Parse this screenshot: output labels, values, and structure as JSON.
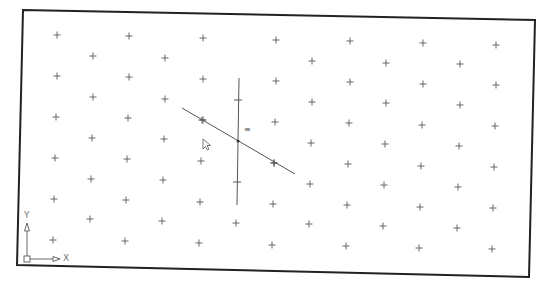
{
  "viewport": {
    "frame_corners": {
      "top_left": [
        23,
        10
      ],
      "top_right": [
        535,
        20
      ],
      "bottom_right": [
        529,
        277
      ],
      "bottom_left": [
        17,
        265
      ]
    },
    "background": "#ffffff",
    "frame_color": "#222222"
  },
  "grid": {
    "marker": "+",
    "color": "#666666",
    "rows": [
      [
        [
          57,
          35
        ],
        [
          129,
          36
        ],
        [
          203,
          38
        ],
        [
          276,
          40
        ],
        [
          350,
          41
        ],
        [
          423,
          43
        ],
        [
          496,
          45
        ]
      ],
      [
        [
          93,
          56
        ],
        [
          165,
          58
        ],
        [
          312,
          61
        ],
        [
          386,
          63
        ],
        [
          460,
          64
        ]
      ],
      [
        [
          57,
          76
        ],
        [
          129,
          77
        ],
        [
          203,
          79
        ],
        [
          276,
          81
        ],
        [
          350,
          82
        ],
        [
          423,
          84
        ],
        [
          496,
          85
        ]
      ],
      [
        [
          93,
          97
        ],
        [
          165,
          99
        ],
        [
          312,
          102
        ],
        [
          386,
          103
        ],
        [
          460,
          105
        ]
      ],
      [
        [
          56,
          117
        ],
        [
          128,
          118
        ],
        [
          202,
          120
        ],
        [
          275,
          122
        ],
        [
          349,
          123
        ],
        [
          422,
          125
        ],
        [
          495,
          126
        ]
      ],
      [
        [
          92,
          138
        ],
        [
          164,
          139
        ],
        [
          311,
          143
        ],
        [
          385,
          144
        ],
        [
          459,
          146
        ]
      ],
      [
        [
          55,
          158
        ],
        [
          127,
          159
        ],
        [
          201,
          161
        ],
        [
          274,
          163
        ],
        [
          348,
          164
        ],
        [
          421,
          166
        ],
        [
          494,
          167
        ]
      ],
      [
        [
          91,
          179
        ],
        [
          163,
          180
        ],
        [
          310,
          184
        ],
        [
          384,
          185
        ],
        [
          458,
          187
        ]
      ],
      [
        [
          54,
          199
        ],
        [
          126,
          200
        ],
        [
          200,
          202
        ],
        [
          273,
          204
        ],
        [
          347,
          205
        ],
        [
          420,
          207
        ],
        [
          493,
          208
        ]
      ],
      [
        [
          90,
          219
        ],
        [
          162,
          221
        ],
        [
          236,
          223
        ],
        [
          309,
          224
        ],
        [
          383,
          226
        ],
        [
          457,
          228
        ]
      ],
      [
        [
          53,
          240
        ],
        [
          125,
          241
        ],
        [
          199,
          243
        ],
        [
          272,
          245
        ],
        [
          346,
          246
        ],
        [
          419,
          248
        ],
        [
          492,
          249
        ]
      ]
    ]
  },
  "drawing": {
    "vertical_line": {
      "from": [
        239,
        78
      ],
      "to": [
        237,
        205
      ],
      "ticks": [
        [
          238,
          100
        ],
        [
          237,
          182
        ]
      ]
    },
    "diagonal_line": {
      "from": [
        182,
        108
      ],
      "to": [
        295,
        174
      ],
      "ticks": [
        [
          203,
          120
        ],
        [
          274,
          163
        ]
      ]
    },
    "intersection": [
      238,
      141
    ],
    "parallel_marker": {
      "glyph": "≡",
      "position": [
        247,
        131
      ]
    },
    "line_color": "#555555"
  },
  "cursor": {
    "icon": "arrow-cursor-icon",
    "position": [
      203,
      139
    ]
  },
  "ucs_icon": {
    "origin": [
      27,
      259
    ],
    "y_label": "Y",
    "x_label": "X",
    "color": "#666666"
  }
}
